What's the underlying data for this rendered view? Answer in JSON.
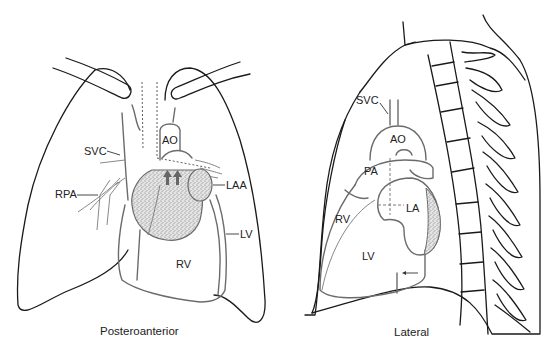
{
  "figure": {
    "panels": [
      {
        "id": "posteroanterior",
        "caption": "Posteroanterior",
        "labels": {
          "svc": "SVC",
          "ao": "AO",
          "rpa": "RPA",
          "laa": "LAA",
          "lv": "LV",
          "rv": "RV"
        }
      },
      {
        "id": "lateral",
        "caption": "Lateral",
        "labels": {
          "svc": "SVC",
          "ao": "AO",
          "pa": "PA",
          "rv": "RV",
          "la": "LA",
          "lv": "LV"
        }
      }
    ]
  },
  "colors": {
    "outline": "#1a1a1a",
    "heart_outline": "#6b6b6b",
    "stipple": "#8a8a8a",
    "arrow_fill": "#666666"
  }
}
